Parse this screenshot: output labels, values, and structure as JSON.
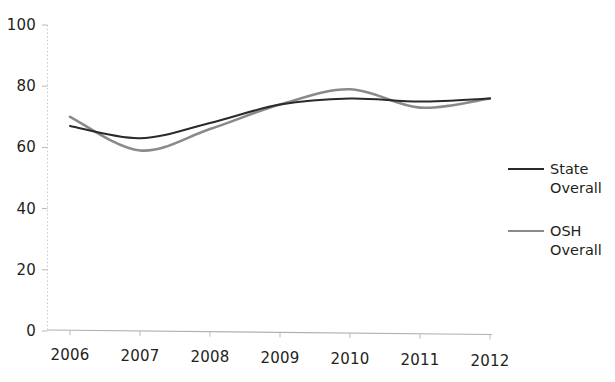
{
  "chart_data": {
    "type": "line",
    "title": "",
    "subtitle": "",
    "xlabel": "",
    "ylabel": "",
    "x": [
      2006,
      2007,
      2008,
      2009,
      2010,
      2011,
      2012
    ],
    "categories": [
      "2006",
      "2007",
      "2008",
      "2009",
      "2010",
      "2011",
      "2012"
    ],
    "series": [
      {
        "name": "State Overall",
        "color": "#2a2a2a",
        "values": [
          67,
          63,
          68,
          74,
          76,
          75,
          76
        ]
      },
      {
        "name": "OSH Overall",
        "color": "#8a8a8a",
        "values": [
          70,
          59,
          66,
          74,
          79,
          73,
          76
        ]
      }
    ],
    "ylim": [
      0,
      100
    ],
    "xlim": [
      2006,
      2012
    ],
    "ytick_labels": [
      "0",
      "20",
      "40",
      "60",
      "80",
      "100"
    ],
    "ytick_values": [
      0,
      20,
      40,
      60,
      80,
      100
    ],
    "grid": false,
    "smoothed": true,
    "legend_position": "right"
  },
  "axes": {
    "y_ticks": [
      {
        "label": "100",
        "value": 100
      },
      {
        "label": "80",
        "value": 80
      },
      {
        "label": "60",
        "value": 60
      },
      {
        "label": "40",
        "value": 40
      },
      {
        "label": "20",
        "value": 20
      },
      {
        "label": "0",
        "value": 0
      }
    ],
    "x_ticks": [
      {
        "label": "2006",
        "value": 2006
      },
      {
        "label": "2007",
        "value": 2007
      },
      {
        "label": "2008",
        "value": 2008
      },
      {
        "label": "2009",
        "value": 2009
      },
      {
        "label": "2010",
        "value": 2010
      },
      {
        "label": "2011",
        "value": 2011
      },
      {
        "label": "2012",
        "value": 2012
      }
    ]
  },
  "legend": {
    "entries": [
      {
        "label": "State\nOverall",
        "color": "#2a2a2a",
        "width": 2.6
      },
      {
        "label": "OSH\nOverall",
        "color": "#8a8a8a",
        "width": 2.2
      }
    ]
  },
  "colors": {
    "state_overall": "#2a2a2a",
    "osh_overall": "#8a8a8a",
    "axis": "#b9b9b9",
    "text": "#231f20",
    "background": "#ffffff"
  }
}
